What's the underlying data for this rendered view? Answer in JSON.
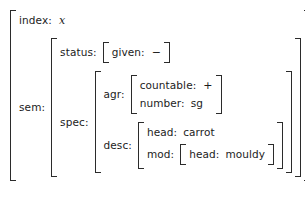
{
  "figure": {
    "kind": "attribute-value-matrix"
  },
  "attributes": {
    "index": "index:",
    "sem": "sem:",
    "status": "status:",
    "given": "given:",
    "spec": "spec:",
    "agr": "agr:",
    "countable": "countable:",
    "number": "number:",
    "desc": "desc:",
    "head": "head:",
    "mod": "mod:",
    "mod_head": "head:"
  },
  "values": {
    "index": "x",
    "given": "−",
    "countable": "+",
    "number": "sg",
    "head": "carrot",
    "mod_head": "mouldy"
  },
  "colors": {
    "text": "#1c1c1c",
    "bracket": "#2b2b2b",
    "background": "#ffffff"
  }
}
